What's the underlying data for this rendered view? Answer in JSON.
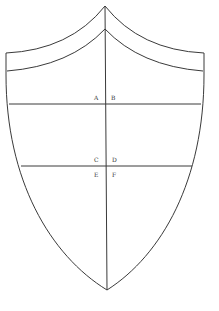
{
  "diagram": {
    "type": "shield-construction",
    "stroke_color": "#3a3a3a",
    "labels": [
      {
        "id": "A",
        "text": "A"
      },
      {
        "id": "B",
        "text": "B"
      },
      {
        "id": "C",
        "text": "C"
      },
      {
        "id": "D",
        "text": "D"
      },
      {
        "id": "E",
        "text": "E"
      },
      {
        "id": "F",
        "text": "F"
      }
    ]
  }
}
